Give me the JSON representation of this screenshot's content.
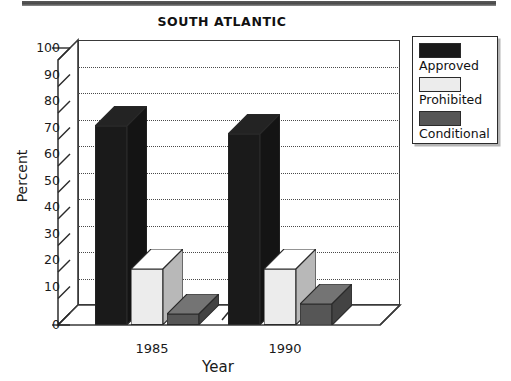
{
  "figure": {
    "title": "SOUTH ATLANTIC",
    "scan_edge": "page-scan-edge"
  },
  "axes": {
    "ylabel": "Percent",
    "xlabel": "Year",
    "yticks": [
      "100",
      "90",
      "80",
      "70",
      "60",
      "50",
      "40",
      "30",
      "20",
      "10",
      "0"
    ],
    "xticks": [
      "1985",
      "1990"
    ]
  },
  "legend": {
    "items": [
      {
        "label": "Approved",
        "color": "#1a1a1a"
      },
      {
        "label": "Prohibited",
        "color": "#ececec"
      },
      {
        "label": "Conditional",
        "color": "#565656"
      }
    ]
  },
  "chart_data": {
    "type": "bar",
    "title": "SOUTH ATLANTIC",
    "xlabel": "Year",
    "ylabel": "Percent",
    "categories": [
      "1985",
      "1990"
    ],
    "series": [
      {
        "name": "Approved",
        "color": "#1a1a1a",
        "values": [
          75,
          72
        ]
      },
      {
        "name": "Prohibited",
        "color": "#ececec",
        "values": [
          21,
          21
        ]
      },
      {
        "name": "Conditional",
        "color": "#565656",
        "values": [
          4,
          8
        ]
      }
    ],
    "ylim": [
      0,
      100
    ],
    "ytick_step": 10,
    "grid": "horizontal-dotted",
    "legend_position": "right-outside",
    "style": "3d-grouped-bar",
    "axis_break": true
  }
}
